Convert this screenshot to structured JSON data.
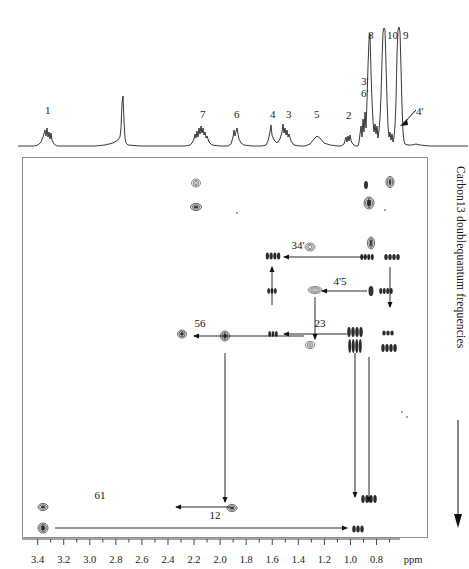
{
  "figure": {
    "type": "nmr-2d-incredible-spectrum",
    "yaxis_label": "Carbon13 doublequantum frequencies",
    "xaxis_unit": "ppm"
  },
  "xaxis": {
    "unit_label": "ppm",
    "ticks": [
      3.4,
      3.2,
      3.0,
      2.8,
      2.6,
      2.4,
      2.2,
      2.0,
      1.8,
      1.6,
      1.4,
      1.2,
      1.0,
      0.8
    ],
    "tick_labels": [
      "3.4",
      "3.2",
      "3.0",
      "2.8",
      "2.6",
      "2.4",
      "2.2",
      "2.0",
      "1.8",
      "1.6",
      "1.4",
      "1.2",
      "1.0",
      "0.8"
    ],
    "min_ppm": 0.62,
    "max_ppm": 3.52,
    "direction": "decreasing-left-to-right"
  },
  "trace_1d": {
    "name": "proton-1d-projection",
    "peak_labels": [
      {
        "id": "1",
        "text": "1",
        "ppm": 3.4,
        "x": 45,
        "y": 105
      },
      {
        "id": "7",
        "text": "7",
        "ppm": 2.13,
        "x": 200,
        "y": 109
      },
      {
        "id": "6",
        "text": "6",
        "ppm": 1.91,
        "x": 234,
        "y": 109
      },
      {
        "id": "4",
        "text": "4",
        "ppm": 1.66,
        "x": 270,
        "y": 109
      },
      {
        "id": "3",
        "text": "3",
        "ppm": 1.58,
        "x": 286,
        "y": 109
      },
      {
        "id": "5",
        "text": "5",
        "ppm": 1.42,
        "x": 314,
        "y": 109
      },
      {
        "id": "2",
        "text": "2",
        "ppm": 1.15,
        "x": 346,
        "y": 110
      },
      {
        "id": "3p",
        "text": "3'",
        "ppm": 1.05,
        "x": 361,
        "y": 76
      },
      {
        "id": "6p",
        "text": "6'",
        "ppm": 1.05,
        "x": 361,
        "y": 88
      },
      {
        "id": "8",
        "text": "8",
        "ppm": 0.99,
        "x": 368,
        "y": 30
      },
      {
        "id": "10",
        "text": "10",
        "ppm": 0.92,
        "x": 387,
        "y": 30
      },
      {
        "id": "9",
        "text": "9",
        "ppm": 0.87,
        "x": 403,
        "y": 30
      },
      {
        "id": "4p",
        "text": "4'",
        "ppm": 0.78,
        "x": 416,
        "y": 106
      }
    ]
  },
  "chart_data": {
    "type": "scatter",
    "title": "",
    "xlabel": "ppm",
    "ylabel": "Carbon13 doublequantum frequencies",
    "xlim": [
      3.52,
      0.62
    ],
    "grid": false,
    "legend": "none",
    "cross_peaks": [
      {
        "x": 196,
        "y": 183,
        "w": 9,
        "h": 8,
        "style": "open"
      },
      {
        "x": 196,
        "y": 207,
        "w": 11,
        "h": 7,
        "style": "solid"
      },
      {
        "x": 237,
        "y": 213,
        "w": 2,
        "h": 2,
        "style": "dot"
      },
      {
        "x": 366,
        "y": 185,
        "w": 4,
        "h": 8,
        "style": "small"
      },
      {
        "x": 390,
        "y": 182,
        "w": 8,
        "h": 11,
        "style": "solid"
      },
      {
        "x": 369,
        "y": 203,
        "w": 10,
        "h": 12,
        "style": "solid"
      },
      {
        "x": 385,
        "y": 210,
        "w": 2,
        "h": 2,
        "style": "dot"
      },
      {
        "x": 310,
        "y": 247,
        "w": 10,
        "h": 8,
        "style": "open"
      },
      {
        "x": 371,
        "y": 243,
        "w": 7,
        "h": 12,
        "style": "solid"
      },
      {
        "x": 273,
        "y": 256,
        "w": 15,
        "h": 7,
        "style": "multi"
      },
      {
        "x": 367,
        "y": 257,
        "w": 14,
        "h": 6,
        "style": "multi"
      },
      {
        "x": 392,
        "y": 257,
        "w": 16,
        "h": 6,
        "style": "multi"
      },
      {
        "x": 272,
        "y": 291,
        "w": 10,
        "h": 6,
        "style": "multi"
      },
      {
        "x": 315,
        "y": 290,
        "w": 14,
        "h": 7,
        "style": "open"
      },
      {
        "x": 371,
        "y": 291,
        "w": 5,
        "h": 10,
        "style": "small"
      },
      {
        "x": 386,
        "y": 291,
        "w": 14,
        "h": 6,
        "style": "multi"
      },
      {
        "x": 273,
        "y": 334,
        "w": 10,
        "h": 6,
        "style": "multi"
      },
      {
        "x": 225,
        "y": 336,
        "w": 9,
        "h": 10,
        "style": "solid"
      },
      {
        "x": 182,
        "y": 334,
        "w": 9,
        "h": 8,
        "style": "solid"
      },
      {
        "x": 310,
        "y": 345,
        "w": 9,
        "h": 7,
        "style": "open"
      },
      {
        "x": 355,
        "y": 332,
        "w": 16,
        "h": 10,
        "style": "multi"
      },
      {
        "x": 355,
        "y": 346,
        "w": 14,
        "h": 14,
        "style": "multi"
      },
      {
        "x": 388,
        "y": 333,
        "w": 12,
        "h": 5,
        "style": "multi"
      },
      {
        "x": 389,
        "y": 348,
        "w": 16,
        "h": 8,
        "style": "multi"
      },
      {
        "x": 402,
        "y": 412,
        "w": 2,
        "h": 2,
        "style": "dot"
      },
      {
        "x": 407,
        "y": 417,
        "w": 2,
        "h": 2,
        "style": "dot"
      },
      {
        "x": 43,
        "y": 507,
        "w": 10,
        "h": 7,
        "style": "solid"
      },
      {
        "x": 232,
        "y": 508,
        "w": 10,
        "h": 7,
        "style": "solid"
      },
      {
        "x": 369,
        "y": 499,
        "w": 16,
        "h": 8,
        "style": "multi"
      },
      {
        "x": 43,
        "y": 528,
        "w": 10,
        "h": 10,
        "style": "solid"
      },
      {
        "x": 358,
        "y": 529,
        "w": 12,
        "h": 7,
        "style": "multi"
      }
    ],
    "correlation_labels": [
      {
        "text": "34'",
        "x": 298,
        "y": 249
      },
      {
        "text": "4'5",
        "x": 340,
        "y": 285
      },
      {
        "text": "23",
        "x": 320,
        "y": 327
      },
      {
        "text": "56",
        "x": 200,
        "y": 327
      },
      {
        "text": "61",
        "x": 100,
        "y": 499
      },
      {
        "text": "12",
        "x": 215,
        "y": 519
      }
    ]
  }
}
